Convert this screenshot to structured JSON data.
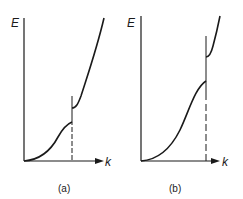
{
  "figure": {
    "panels": [
      {
        "id": "a",
        "caption": "(a)",
        "y_axis_label": "E",
        "x_axis_label": "k",
        "description": "Dispersion E(k) with small band gap at zone boundary"
      },
      {
        "id": "b",
        "caption": "(b)",
        "y_axis_label": "E",
        "x_axis_label": "k",
        "description": "Dispersion E(k) with larger band gap at zone boundary"
      }
    ],
    "colors": {
      "ink": "#1a1a1a",
      "background": "#ffffff"
    }
  }
}
